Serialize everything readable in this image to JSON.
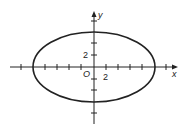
{
  "diagram": {
    "type": "ellipse-graph",
    "axes": {
      "x_label": "x",
      "y_label": "y",
      "origin_label": "O"
    },
    "tick_labels": {
      "x": "2",
      "y": "2"
    },
    "tick_spacing_units": 2,
    "ellipse": {
      "a": 10,
      "b": 6,
      "center": [
        0,
        0
      ]
    },
    "colors": {
      "stroke": "#222222",
      "background": "#ffffff"
    }
  }
}
